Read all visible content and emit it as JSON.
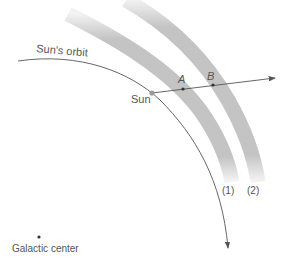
{
  "diagram": {
    "labels": {
      "orbit": "Sun's orbit",
      "sun": "Sun",
      "point_a": "A",
      "point_b": "B",
      "arm_1": "(1)",
      "arm_2": "(2)",
      "galactic_center": "Galactic center"
    },
    "colors": {
      "band": "#bdbdbd",
      "line": "#555555",
      "sun_dot": "#999999",
      "text": "#555555"
    }
  }
}
